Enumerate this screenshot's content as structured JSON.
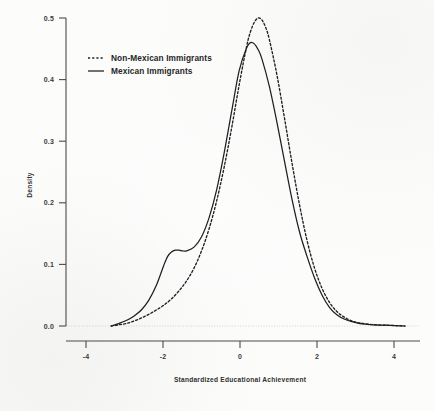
{
  "chart_data": {
    "type": "line",
    "title": "",
    "xlabel": "Standardized Educational Achievement",
    "ylabel": "Density",
    "xlim": [
      -4.8,
      4.6
    ],
    "ylim": [
      0.0,
      0.53
    ],
    "grid": false,
    "legend_position": "upper-left",
    "xticks": [
      "-4",
      "-2",
      "0",
      "2",
      "4"
    ],
    "xtick_values": [
      -4,
      -2,
      0,
      2,
      4
    ],
    "yticks": [
      "0.0",
      "0.1",
      "0.2",
      "0.3",
      "0.4",
      "0.5"
    ],
    "ytick_values": [
      0.0,
      0.1,
      0.2,
      0.3,
      0.4,
      0.5
    ],
    "series": [
      {
        "name": "Non-Mexican Immigrants",
        "style": "dashed",
        "color": "#1f1f1f",
        "peak_x": 0.3,
        "peak_y": 0.5,
        "x": [
          -3.6,
          -3.4,
          -3.2,
          -3.0,
          -2.8,
          -2.6,
          -2.4,
          -2.2,
          -2.0,
          -1.8,
          -1.6,
          -1.4,
          -1.2,
          -1.0,
          -0.8,
          -0.6,
          -0.4,
          -0.2,
          0.0,
          0.1,
          0.2,
          0.3,
          0.4,
          0.5,
          0.6,
          0.8,
          1.0,
          1.2,
          1.4,
          1.6,
          1.8,
          2.0,
          2.2,
          2.4,
          2.6,
          2.8,
          3.0,
          3.4,
          3.8,
          4.2
        ],
        "y": [
          0.0,
          0.002,
          0.004,
          0.008,
          0.013,
          0.019,
          0.026,
          0.034,
          0.044,
          0.057,
          0.073,
          0.094,
          0.122,
          0.158,
          0.203,
          0.258,
          0.322,
          0.392,
          0.455,
          0.478,
          0.493,
          0.5,
          0.497,
          0.485,
          0.465,
          0.408,
          0.338,
          0.265,
          0.197,
          0.139,
          0.094,
          0.061,
          0.038,
          0.023,
          0.014,
          0.008,
          0.005,
          0.002,
          0.001,
          0.0
        ]
      },
      {
        "name": "Mexican Immigrants",
        "style": "solid",
        "color": "#1f1f1f",
        "peak_x": 0.1,
        "peak_y": 0.46,
        "shoulder_x": -2.0,
        "shoulder_y": 0.12,
        "x": [
          -3.6,
          -3.4,
          -3.2,
          -3.0,
          -2.8,
          -2.6,
          -2.4,
          -2.2,
          -2.1,
          -2.0,
          -1.9,
          -1.8,
          -1.7,
          -1.6,
          -1.4,
          -1.2,
          -1.0,
          -0.8,
          -0.6,
          -0.4,
          -0.2,
          0.0,
          0.1,
          0.2,
          0.3,
          0.4,
          0.6,
          0.8,
          1.0,
          1.2,
          1.4,
          1.6,
          1.8,
          2.0,
          2.2,
          2.4,
          2.6,
          2.8,
          3.0,
          3.4,
          3.8,
          4.2
        ],
        "y": [
          0.0,
          0.004,
          0.009,
          0.016,
          0.026,
          0.042,
          0.066,
          0.099,
          0.113,
          0.12,
          0.123,
          0.123,
          0.122,
          0.122,
          0.128,
          0.145,
          0.176,
          0.221,
          0.281,
          0.349,
          0.415,
          0.452,
          0.46,
          0.458,
          0.449,
          0.434,
          0.389,
          0.331,
          0.268,
          0.206,
          0.153,
          0.113,
          0.078,
          0.05,
          0.03,
          0.018,
          0.011,
          0.007,
          0.004,
          0.002,
          0.001,
          0.0
        ]
      }
    ]
  },
  "axes": {
    "ylabel": "Density",
    "xlabel": "Standardized Educational Achievement",
    "xtick_labels": [
      "-4",
      "-2",
      "0",
      "2",
      "4"
    ],
    "ytick_labels": [
      "0.0",
      "0.1",
      "0.2",
      "0.3",
      "0.4",
      "0.5"
    ]
  },
  "legend": {
    "items": [
      {
        "label": "Non-Mexican Immigrants",
        "style": "dashed"
      },
      {
        "label": "Mexican Immigrants",
        "style": "solid"
      }
    ]
  }
}
